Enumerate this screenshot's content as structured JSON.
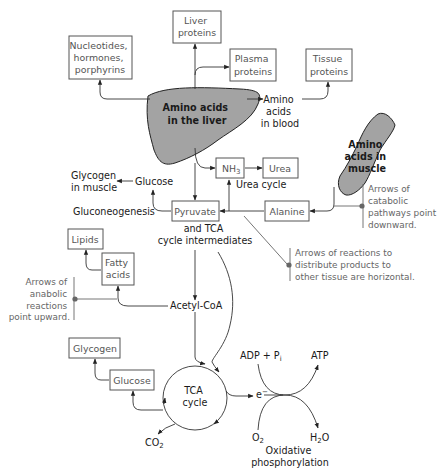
{
  "diagram": {
    "organs": {
      "liver": {
        "line1": "Amino acids",
        "line2": "in the liver",
        "fill": "#a3a3a3"
      },
      "muscle": {
        "line1": "Amino",
        "line2": "acids in",
        "line3": "muscle",
        "fill": "#a3a3a3"
      }
    },
    "boxes": {
      "liver_proteins": {
        "line1": "Liver",
        "line2": "proteins"
      },
      "nucleotides": {
        "line1": "Nucleotides,",
        "line2": "hormones,",
        "line3": "porphyrins"
      },
      "plasma_proteins": {
        "line1": "Plasma",
        "line2": "proteins"
      },
      "tissue_proteins": {
        "line1": "Tissue",
        "line2": "proteins"
      },
      "nh3": {
        "main": "NH",
        "sub": "3"
      },
      "urea": {
        "label": "Urea"
      },
      "pyruvate": {
        "label": "Pyruvate"
      },
      "alanine": {
        "label": "Alanine"
      },
      "lipids": {
        "label": "Lipids"
      },
      "fatty_acids": {
        "line1": "Fatty",
        "line2": "acids"
      },
      "glycogen": {
        "label": "Glycogen"
      },
      "glucose_bottom": {
        "label": "Glucose"
      }
    },
    "labels": {
      "amino_blood": {
        "line1": "Amino",
        "line2": "acids",
        "line3": "in blood"
      },
      "glycogen_muscle": {
        "line1": "Glycogen",
        "line2": "in muscle"
      },
      "glucose_top": "Glucose",
      "urea_cycle": "Urea cycle",
      "gluconeogenesis": "Gluconeogenesis",
      "tca_intermediates": {
        "line1": "and TCA",
        "line2": "cycle intermediates"
      },
      "acetyl_coa": "Acetyl-CoA",
      "tca_cycle": {
        "line1": "TCA",
        "line2": "cycle"
      },
      "co2": {
        "main": "CO",
        "sub": "2"
      },
      "electron": {
        "main": "e",
        "sup": "−"
      },
      "adp": {
        "main": "ADP + P",
        "sub": "i"
      },
      "atp": "ATP",
      "o2": {
        "main": "O",
        "sub": "2"
      },
      "h2o": {
        "main1": "H",
        "sub": "2",
        "main2": "O"
      },
      "oxphos": {
        "line1": "Oxidative",
        "line2": "phosphorylation"
      }
    },
    "notes": {
      "catabolic": {
        "line1": "Arrows of",
        "line2": "catabolic",
        "line3": "pathways point",
        "line4": "downward."
      },
      "distribute": {
        "line1": "Arrows of reactions to",
        "line2": "distribute products to",
        "line3": "other tissue are horizontal."
      },
      "anabolic": {
        "line1": "Arrows of",
        "line2": "anabolic",
        "line3": "reactions",
        "line4": "point upward."
      }
    }
  }
}
